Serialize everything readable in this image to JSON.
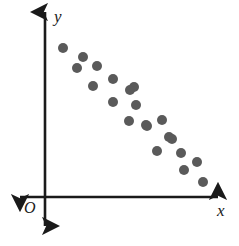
{
  "figure": {
    "width": 239,
    "height": 246,
    "background_color": "#ffffff"
  },
  "axes": {
    "origin_label": "O",
    "x_axis_label": "x",
    "y_axis_label": "y",
    "axis_color": "#1a1a1a",
    "axis_line_width": 2.6,
    "origin_px": {
      "x": 45,
      "y": 197
    },
    "x_axis": {
      "x_start": 20,
      "x_end": 218,
      "y": 197,
      "arrow_left": true,
      "arrow_right": true
    },
    "y_axis": {
      "y_start": 12,
      "y_end": 226,
      "x": 45,
      "arrow_up": true,
      "arrow_down": true
    }
  },
  "chart_data": {
    "type": "scatter",
    "title": "",
    "xlabel": "x",
    "ylabel": "y",
    "grid": false,
    "legend": null,
    "ticks": {
      "x": [],
      "y": []
    },
    "marker": {
      "shape": "circle",
      "color": "#5a5a5a",
      "diameter_px": 10,
      "count": 21
    },
    "correlation": "negative",
    "note": "Two roughly parallel descending bands of points from upper-left to lower-right",
    "points_px": [
      {
        "x": 63,
        "y": 48
      },
      {
        "x": 83,
        "y": 57
      },
      {
        "x": 77,
        "y": 68
      },
      {
        "x": 97,
        "y": 66
      },
      {
        "x": 93,
        "y": 86
      },
      {
        "x": 113,
        "y": 79
      },
      {
        "x": 134,
        "y": 87
      },
      {
        "x": 113,
        "y": 102
      },
      {
        "x": 136,
        "y": 105
      },
      {
        "x": 129,
        "y": 121
      },
      {
        "x": 147,
        "y": 126
      },
      {
        "x": 162,
        "y": 120
      },
      {
        "x": 169,
        "y": 137
      },
      {
        "x": 157,
        "y": 151
      },
      {
        "x": 181,
        "y": 153
      },
      {
        "x": 197,
        "y": 162
      },
      {
        "x": 184,
        "y": 170
      },
      {
        "x": 203,
        "y": 182
      },
      {
        "x": 146,
        "y": 125
      },
      {
        "x": 130,
        "y": 90
      },
      {
        "x": 172,
        "y": 139
      }
    ],
    "points_data": [
      {
        "x": 1.0,
        "y": 9.1
      },
      {
        "x": 2.2,
        "y": 8.6
      },
      {
        "x": 1.9,
        "y": 8.0
      },
      {
        "x": 3.1,
        "y": 8.1
      },
      {
        "x": 2.9,
        "y": 6.9
      },
      {
        "x": 4.1,
        "y": 7.3
      },
      {
        "x": 5.3,
        "y": 6.9
      },
      {
        "x": 4.1,
        "y": 5.7
      },
      {
        "x": 5.4,
        "y": 5.5
      },
      {
        "x": 5.0,
        "y": 4.6
      },
      {
        "x": 6.1,
        "y": 4.3
      },
      {
        "x": 7.0,
        "y": 4.6
      },
      {
        "x": 7.4,
        "y": 3.6
      },
      {
        "x": 6.7,
        "y": 2.8
      },
      {
        "x": 8.1,
        "y": 2.7
      },
      {
        "x": 9.0,
        "y": 2.1
      },
      {
        "x": 8.3,
        "y": 1.6
      },
      {
        "x": 9.4,
        "y": 0.9
      },
      {
        "x": 6.0,
        "y": 4.3
      },
      {
        "x": 5.0,
        "y": 6.7
      },
      {
        "x": 7.5,
        "y": 3.5
      }
    ],
    "xlim": [
      0,
      10.5
    ],
    "ylim": [
      0,
      10.5
    ]
  }
}
